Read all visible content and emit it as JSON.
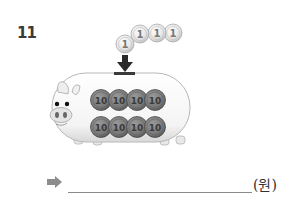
{
  "problem": {
    "number": "11"
  },
  "illustration": {
    "subject": "piggy-bank",
    "slot_arrow": "down-arrow",
    "falling_coins": {
      "count": 4,
      "denomination_label": "1",
      "items": [
        {
          "label": "1",
          "cx": 125,
          "cy": 44
        },
        {
          "label": "1",
          "cx": 140,
          "cy": 33
        },
        {
          "label": "1",
          "cx": 157,
          "cy": 33
        },
        {
          "label": "1",
          "cx": 173,
          "cy": 33
        }
      ]
    },
    "deposited_coins": {
      "count": 8,
      "denomination_label": "10",
      "rows": [
        [
          {
            "label": "10"
          },
          {
            "label": "10"
          },
          {
            "label": "10"
          },
          {
            "label": "10"
          }
        ],
        [
          {
            "label": "10"
          },
          {
            "label": "10"
          },
          {
            "label": "10"
          },
          {
            "label": "10"
          }
        ]
      ]
    }
  },
  "answer": {
    "arrow_icon": "right-arrow-icon",
    "value": "",
    "unit": "(원)"
  },
  "colors": {
    "problem_number": "#3a3a3a",
    "arrow": "#8c8c8c",
    "coin_10_fill": "#7a7a7a",
    "coin_1_fill": "#e6e6e6",
    "pig_body": "#f7f7f7",
    "pig_outline": "#bdbdbd"
  }
}
